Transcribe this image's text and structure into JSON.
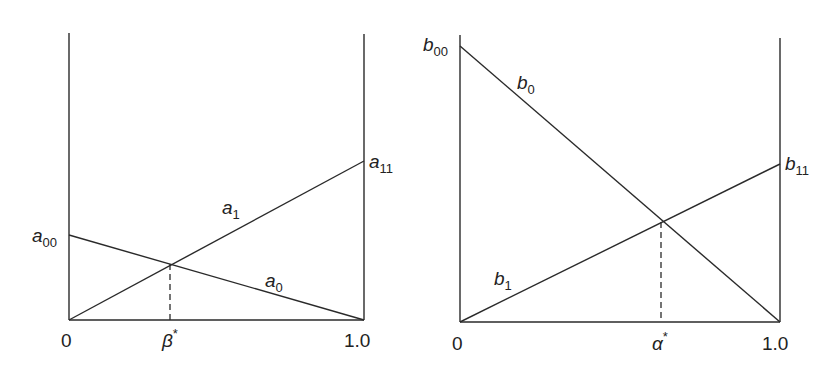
{
  "left_panel": {
    "labels": {
      "a00": {
        "base": "a",
        "sub": "00"
      },
      "a11": {
        "base": "a",
        "sub": "11"
      },
      "a1": {
        "base": "a",
        "sub": "1"
      },
      "a0": {
        "base": "a",
        "sub": "0"
      }
    },
    "x_ticks": {
      "start": "0",
      "end": "1.0",
      "marker": "β",
      "marker_sup": "*"
    }
  },
  "right_panel": {
    "labels": {
      "b00": {
        "base": "b",
        "sub": "00"
      },
      "b11": {
        "base": "b",
        "sub": "11"
      },
      "b0": {
        "base": "b",
        "sub": "0"
      },
      "b1": {
        "base": "b",
        "sub": "1"
      }
    },
    "x_ticks": {
      "start": "0",
      "end": "1.0",
      "marker": "α",
      "marker_sup": "*"
    }
  },
  "colors": {
    "line": "#2a2a2a",
    "background": "#ffffff"
  }
}
